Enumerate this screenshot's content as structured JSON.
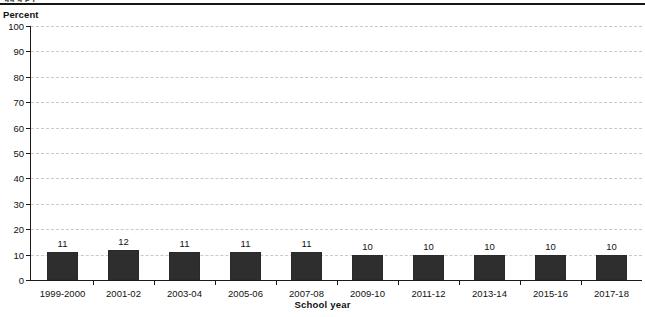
{
  "figure": {
    "cut_off_caption": "gg g p j",
    "y_axis_title": "Percent",
    "x_axis_title": "School year"
  },
  "chart_data": {
    "type": "bar",
    "title": "",
    "subtitle": "",
    "xlabel": "School year",
    "ylabel": "Percent",
    "categories": [
      "1999-2000",
      "2001-02",
      "2003-04",
      "2005-06",
      "2007-08",
      "2009-10",
      "2011-12",
      "2013-14",
      "2015-16",
      "2017-18"
    ],
    "values": [
      11,
      12,
      11,
      11,
      11,
      10,
      10,
      10,
      10,
      10
    ],
    "data_labels": [
      "11",
      "12",
      "11",
      "11",
      "11",
      "10",
      "10",
      "10",
      "10",
      "10"
    ],
    "ylim": [
      0,
      100
    ],
    "ytick_values": [
      0,
      10,
      20,
      30,
      40,
      50,
      60,
      70,
      80,
      90,
      100
    ],
    "ytick_labels": [
      "0",
      "10",
      "20",
      "30",
      "40",
      "50",
      "60",
      "70",
      "80",
      "90",
      "100"
    ],
    "grid": "horizontal-dashed",
    "legend": "none",
    "bar_color": "#2e2e2e",
    "grid_color": "#c9c9c9",
    "axis_color": "#1a1a1a"
  }
}
